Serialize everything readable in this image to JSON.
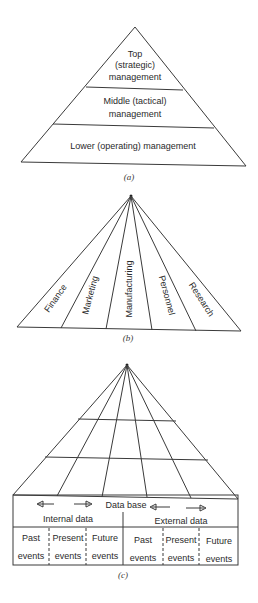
{
  "figure_a": {
    "levels": [
      {
        "lines": [
          "Top",
          "(strategic)",
          "management"
        ]
      },
      {
        "lines": [
          "Middle (tactical)",
          "management"
        ]
      },
      {
        "lines": [
          "Lower (operating) management"
        ]
      }
    ],
    "caption": "(a)"
  },
  "figure_b": {
    "functions": [
      "Finance",
      "Marketing",
      "Manufacturing",
      "Personnel",
      "Research"
    ],
    "caption": "(b)"
  },
  "figure_c": {
    "database_label": "Data base",
    "internal_label": "Internal data",
    "external_label": "External data",
    "internal_cells": [
      {
        "line1": "Past",
        "line2": "events"
      },
      {
        "line1": "Present",
        "line2": "events"
      },
      {
        "line1": "Future",
        "line2": "events"
      }
    ],
    "external_cells": [
      {
        "line1": "Past",
        "line2": "events"
      },
      {
        "line1": "Present",
        "line2": "events"
      },
      {
        "line1": "Future",
        "line2": "events"
      }
    ],
    "caption": "(c)"
  }
}
